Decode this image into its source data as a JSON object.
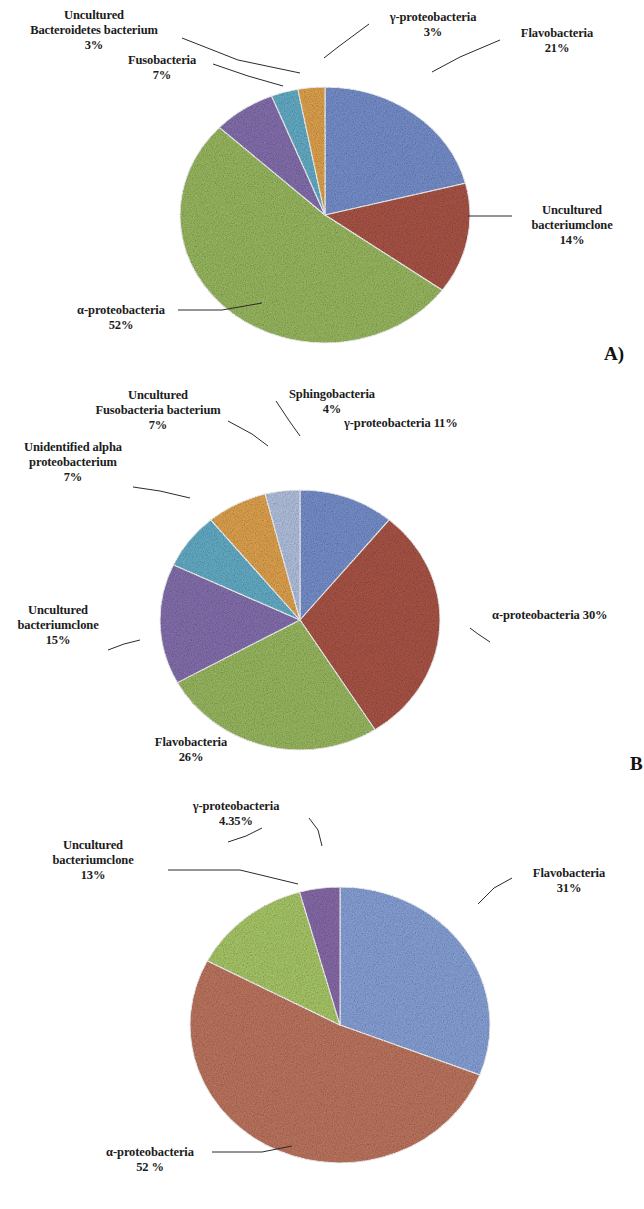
{
  "figure": {
    "background": "#ffffff",
    "panel_letters": [
      "A)",
      "B",
      "C)"
    ]
  },
  "palette": {
    "blue": "#7b95d4",
    "red_brown": "#b1584a",
    "green": "#9fc064",
    "purple": "#8a74b5",
    "cyan": "#68b4cf",
    "orange": "#e8a951",
    "light_blue": "#b9c9e8",
    "light_green": "#afd06c",
    "light_purple": "#8d6fb0",
    "salmon": "#c57a63",
    "periwinkle": "#8da8e0"
  },
  "chart_data": [
    {
      "id": "panel-a",
      "type": "pie",
      "title": "",
      "panel_letter": "A)",
      "start_angle_deg": 0,
      "labels": [
        "Flavobacteria",
        "Uncultured bacteriumclone",
        "α-proteobacteria",
        "Fusobacteria",
        "Uncultured Bacteroidetes bacterium",
        "γ-proteobacteria"
      ],
      "values": [
        21,
        14,
        52,
        7,
        3,
        3
      ],
      "colors": [
        "#7b95d4",
        "#b1584a",
        "#9fc064",
        "#8a74b5",
        "#68b4cf",
        "#e8a951"
      ],
      "slices": [
        {
          "name": "Flavobacteria",
          "value": 21,
          "pct_text": "21%",
          "color": "#7b95d4"
        },
        {
          "name": "Uncultured bacteriumclone",
          "value": 14,
          "pct_text": "14%",
          "color": "#b1584a"
        },
        {
          "name": "α-proteobacteria",
          "value": 52,
          "pct_text": "52%",
          "color": "#9fc064"
        },
        {
          "name": "Fusobacteria",
          "value": 7,
          "pct_text": "7%",
          "color": "#8a74b5"
        },
        {
          "name": "Uncultured Bacteroidetes bacterium",
          "value": 3,
          "pct_text": "3%",
          "color": "#68b4cf"
        },
        {
          "name": "γ-proteobacteria",
          "value": 3,
          "pct_text": "3%",
          "color": "#e8a951"
        }
      ],
      "callouts": {
        "gamma": {
          "line1": "γ-proteobacteria",
          "pct": "3%"
        },
        "flavo": {
          "line1": "Flavobacteria",
          "pct": "21%"
        },
        "unc_clone": {
          "line1": "Uncultured",
          "line2": "bacteriumclone",
          "pct": "14%"
        },
        "alpha": {
          "line1": "α-proteobacteria",
          "pct": "52%"
        },
        "fuso": {
          "line1": "Fusobacteria",
          "pct": "7%"
        },
        "bacteroidetes": {
          "line1": "Uncultured",
          "line2": "Bacteroidetes bacterium",
          "pct": "3%"
        }
      }
    },
    {
      "id": "panel-b",
      "type": "pie",
      "title": "",
      "panel_letter": "B",
      "start_angle_deg": 0,
      "labels": [
        "γ-proteobacteria",
        "α-proteobacteria",
        "Flavobacteria",
        "Uncultured bacteriumclone",
        "Unidentified alpha proteobacterium",
        "Uncultured Fusobacteria bacterium",
        "Sphingobacteria"
      ],
      "values": [
        11,
        30,
        26,
        15,
        7,
        7,
        4
      ],
      "colors": [
        "#7b95d4",
        "#b1584a",
        "#9fc064",
        "#8a74b5",
        "#68b4cf",
        "#e8a951",
        "#b9c9e8"
      ],
      "slices": [
        {
          "name": "γ-proteobacteria",
          "value": 11,
          "pct_text": "11%",
          "color": "#7b95d4"
        },
        {
          "name": "α-proteobacteria",
          "value": 30,
          "pct_text": "30%",
          "color": "#b1584a"
        },
        {
          "name": "Flavobacteria",
          "value": 26,
          "pct_text": "26%",
          "color": "#9fc064"
        },
        {
          "name": "Uncultured bacteriumclone",
          "value": 15,
          "pct_text": "15%",
          "color": "#8a74b5"
        },
        {
          "name": "Unidentified alpha proteobacterium",
          "value": 7,
          "pct_text": "7%",
          "color": "#68b4cf"
        },
        {
          "name": "Uncultured Fusobacteria bacterium",
          "value": 7,
          "pct_text": "7%",
          "color": "#e8a951"
        },
        {
          "name": "Sphingobacteria",
          "value": 4,
          "pct_text": "4%",
          "color": "#b9c9e8"
        }
      ],
      "callouts": {
        "sphingo": {
          "line1": "Sphingobacteria",
          "pct": "4%"
        },
        "gamma": {
          "line1": "γ-proteobacteria 11%"
        },
        "alpha": {
          "line1": "α-proteobacteria 30%"
        },
        "flavo": {
          "line1": "Flavobacteria",
          "pct": "26%"
        },
        "unc_clone": {
          "line1": "Uncultured",
          "line2": "bacteriumclone",
          "pct": "15%"
        },
        "unid_alpha": {
          "line1": "Unidentified alpha",
          "line2": "proteobacterium",
          "pct": "7%"
        },
        "unc_fuso": {
          "line1": "Uncultured",
          "line2": "Fusobacteria bacterium",
          "pct": "7%"
        }
      }
    },
    {
      "id": "panel-c",
      "type": "pie",
      "title": "",
      "panel_letter": "C)",
      "start_angle_deg": 0,
      "labels": [
        "Flavobacteria",
        "α-proteobacteria",
        "Uncultured bacteriumclone",
        "γ-proteobacteria"
      ],
      "values": [
        31,
        52,
        13,
        4.35
      ],
      "colors": [
        "#8da8e0",
        "#c57a63",
        "#afd06c",
        "#8d6fb0"
      ],
      "slices": [
        {
          "name": "Flavobacteria",
          "value": 31,
          "pct_text": "31%",
          "color": "#8da8e0"
        },
        {
          "name": "α-proteobacteria",
          "value": 52,
          "pct_text": "52 %",
          "color": "#c57a63"
        },
        {
          "name": "Uncultured bacteriumclone",
          "value": 13,
          "pct_text": "13%",
          "color": "#afd06c"
        },
        {
          "name": "γ-proteobacteria",
          "value": 4.35,
          "pct_text": "4.35%",
          "color": "#8d6fb0"
        }
      ],
      "callouts": {
        "gamma": {
          "line1": "γ-proteobacteria",
          "pct": "4.35%"
        },
        "unc_clone": {
          "line1": "Uncultured",
          "line2": "bacteriumclone",
          "pct": "13%"
        },
        "flavo": {
          "line1": "Flavobacteria",
          "pct": "31%"
        },
        "alpha": {
          "line1": "α-proteobacteria",
          "pct": "52 %"
        }
      }
    }
  ]
}
